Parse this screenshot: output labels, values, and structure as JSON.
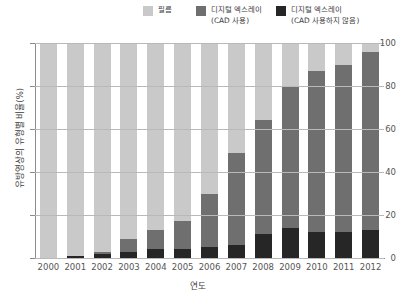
{
  "legend": {
    "items": [
      {
        "label": "필름",
        "color": "#c9c9c9",
        "key": "film"
      },
      {
        "label": "디지털 엑스레이\n(CAD 사용)",
        "color": "#6f6f6f",
        "key": "digital_no_cad"
      },
      {
        "label": "디지털 엑스레이\n(CAD 사용하지 않음)",
        "color": "#262626",
        "key": "digital_cad"
      }
    ]
  },
  "axes": {
    "x_title": "연도",
    "y_title": "유방영상의 유형별 비율(%)",
    "y_ticks": [
      "0",
      "20",
      "40",
      "60",
      "80",
      "100"
    ]
  },
  "colors": {
    "film": "#c9c9c9",
    "digital_no_cad": "#6f6f6f",
    "digital_cad": "#262626",
    "axis": "#8c8c8c",
    "grid": "#b9b9b9",
    "text": "#4a4a4a",
    "background": "#ffffff"
  },
  "chart_data": {
    "type": "bar",
    "title": "",
    "xlabel": "연도",
    "ylabel": "유방영상의 유형별 비율(%)",
    "ylim": [
      0,
      100
    ],
    "yticks": [
      0,
      20,
      40,
      60,
      80,
      100
    ],
    "grid": true,
    "stacked": true,
    "legend_position": "top",
    "categories": [
      "2000",
      "2001",
      "2002",
      "2003",
      "2004",
      "2005",
      "2006",
      "2007",
      "2008",
      "2009",
      "2010",
      "2011",
      "2012"
    ],
    "series": [
      {
        "name": "디지털 엑스레이 (CAD 사용)",
        "color": "#262626",
        "stack_order": 1,
        "values": [
          0,
          1,
          2,
          3,
          4,
          4,
          5,
          6,
          11,
          14,
          12,
          12,
          13
        ]
      },
      {
        "name": "디지털 엑스레이 (CAD 사용하지 않음)",
        "color": "#6f6f6f",
        "stack_order": 2,
        "values": [
          0,
          0,
          1,
          6,
          9,
          13,
          25,
          43,
          53,
          66,
          75,
          78,
          83
        ]
      },
      {
        "name": "필름",
        "color": "#c9c9c9",
        "stack_order": 3,
        "values": [
          100,
          99,
          97,
          91,
          87,
          83,
          70,
          51,
          36,
          20,
          13,
          10,
          4
        ]
      }
    ]
  }
}
